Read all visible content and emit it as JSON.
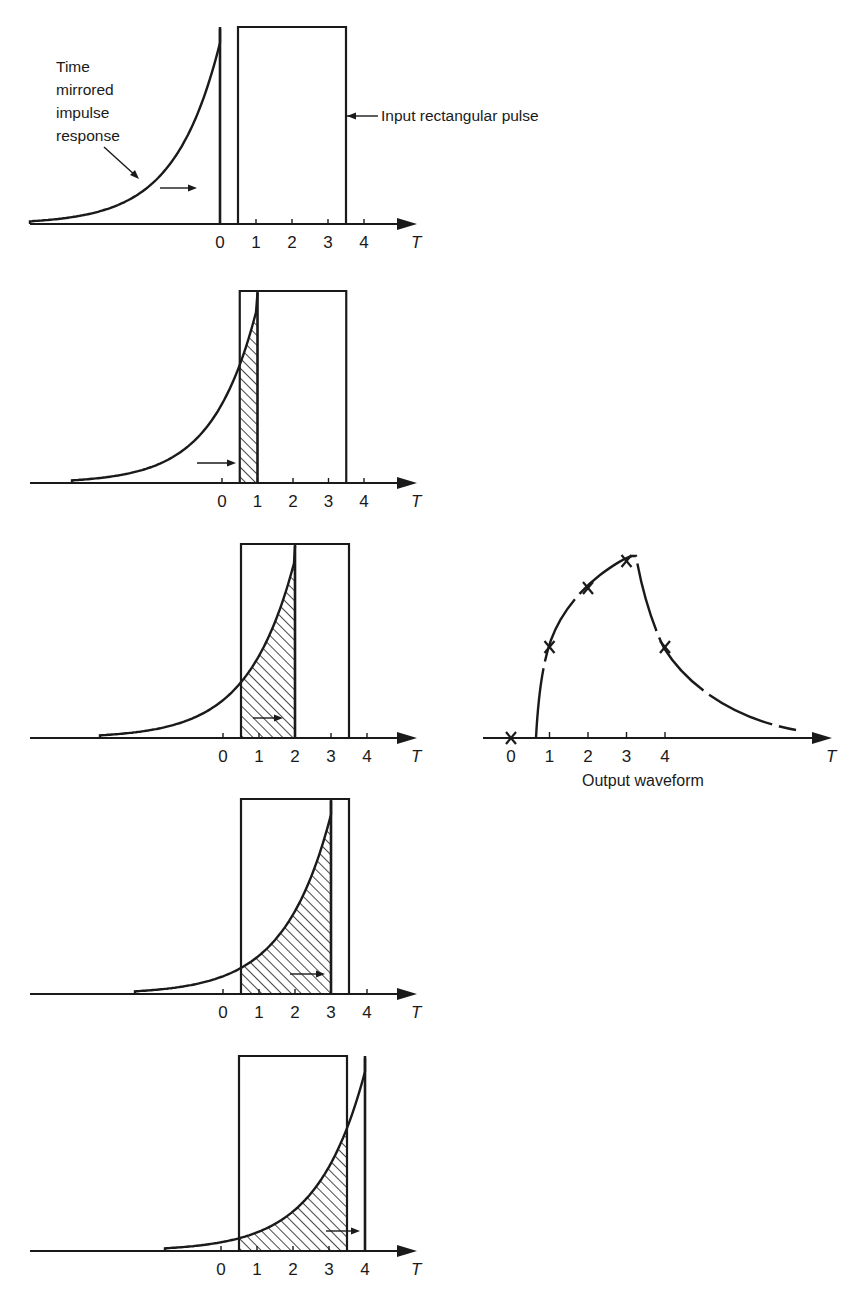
{
  "figure": {
    "colors": {
      "ink": "#1a1a1a",
      "background": "#ffffff"
    },
    "annotations": {
      "impulse_label_lines": [
        "Time",
        "mirrored",
        "impulse",
        "response"
      ],
      "pulse_label": "Input rectangular pulse",
      "output_caption": "Output waveform"
    },
    "axis_symbol": "T",
    "tick_labels": [
      "0",
      "1",
      "2",
      "3",
      "4"
    ],
    "panels": [
      {
        "id": "panel-1",
        "shift_T": 0.0,
        "axis_y": 224,
        "top_y": 27,
        "origin_x": 220,
        "unit_px": 36,
        "pulse": [
          0.5,
          3.5
        ],
        "tail_start_x": 30,
        "shaded": false,
        "arrow": [
          160,
          197
        ]
      },
      {
        "id": "panel-2",
        "shift_T": 1.0,
        "axis_y": 483,
        "top_y": 291,
        "origin_x": 222,
        "unit_px": 35.5,
        "pulse": [
          0.5,
          3.5
        ],
        "tail_start_x": 72,
        "shaded": true,
        "arrow": [
          197,
          236
        ]
      },
      {
        "id": "panel-3",
        "shift_T": 2.0,
        "axis_y": 738,
        "top_y": 544,
        "origin_x": 223,
        "unit_px": 36,
        "pulse": [
          0.5,
          3.5
        ],
        "tail_start_x": 100,
        "shaded": true,
        "arrow": [
          253,
          283
        ]
      },
      {
        "id": "panel-4",
        "shift_T": 3.0,
        "axis_y": 994,
        "top_y": 799,
        "origin_x": 223,
        "unit_px": 36,
        "pulse": [
          0.5,
          3.5
        ],
        "tail_start_x": 135,
        "shaded": true,
        "arrow": [
          290,
          325
        ]
      },
      {
        "id": "panel-5",
        "shift_T": 4.0,
        "axis_y": 1251,
        "top_y": 1056,
        "origin_x": 221,
        "unit_px": 36,
        "pulse": [
          0.5,
          3.5
        ],
        "tail_start_x": 165,
        "shaded": true,
        "arrow": [
          326,
          360
        ]
      }
    ],
    "output_plot": {
      "axis_y": 738,
      "origin_x": 511,
      "unit_px": 38.5,
      "axis_end_x": 832,
      "markers_T": [
        0,
        1,
        2,
        3,
        4
      ],
      "caption": "Output waveform"
    }
  },
  "chart_data": {
    "type": "line",
    "title": "Output waveform",
    "xlabel": "T",
    "ylabel": "",
    "x_ticks": [
      "0",
      "1",
      "2",
      "3",
      "4"
    ],
    "series": [
      {
        "name": "Output (marked samples)",
        "x": [
          0,
          1,
          2,
          3,
          4
        ],
        "y": [
          0,
          0.6,
          0.83,
          1.0,
          0.6
        ]
      }
    ],
    "input_pulse": {
      "start_T": 0.5,
      "end_T": 3.5,
      "label": "Input rectangular pulse"
    },
    "impulse_response": {
      "label": "Time mirrored impulse response",
      "shape": "exponential, mirrored",
      "shifts_T": [
        0,
        1,
        2,
        3,
        4
      ]
    },
    "grid": false
  }
}
